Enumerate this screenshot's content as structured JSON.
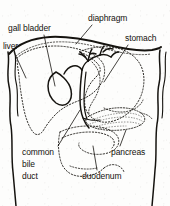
{
  "figure": {
    "type": "anatomical-line-diagram",
    "width": 170,
    "height": 206,
    "background_color": "#fdfdfc",
    "ink_color": "#15130f",
    "label_font_size_px": 8.5
  },
  "labels": {
    "gall_bladder": "gall bladder",
    "diaphragm": "diaphragm",
    "stomach": "stomach",
    "liver": "liver",
    "common_bile_duct_line1": "common",
    "common_bile_duct_line2": "bile",
    "common_bile_duct_line3": "duct",
    "pancreas": "pancreas",
    "duodenum": "duodenum"
  },
  "structures": [
    {
      "name": "body-outline",
      "style": "solid",
      "label": null
    },
    {
      "name": "diaphragm",
      "style": "solid",
      "label": "diaphragm"
    },
    {
      "name": "liver",
      "style": "dotted",
      "label": "liver"
    },
    {
      "name": "gall-bladder",
      "style": "solid",
      "label": "gall bladder"
    },
    {
      "name": "bile-duct-tree",
      "style": "solid",
      "label": "common bile duct"
    },
    {
      "name": "stomach",
      "style": "dotted",
      "label": "stomach"
    },
    {
      "name": "pancreas",
      "style": "stippled",
      "label": "pancreas"
    },
    {
      "name": "duodenum",
      "style": "dotted",
      "label": "duodenum"
    }
  ]
}
